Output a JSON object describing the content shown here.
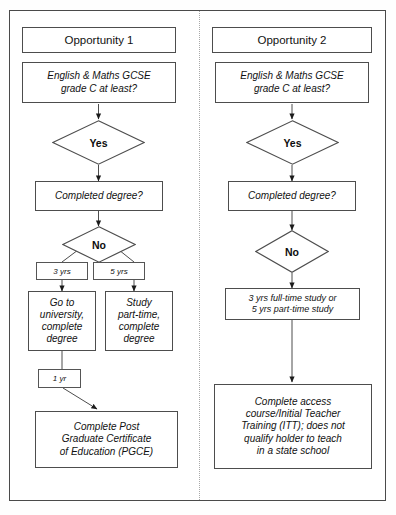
{
  "diagram": {
    "type": "flowchart",
    "columns": [
      {
        "id": "opportunity-1",
        "header": "Opportunity 1",
        "nodes": [
          {
            "id": "gcse-1",
            "shape": "process",
            "text": "English & Maths GCSE grade C at least?"
          },
          {
            "id": "yes-1",
            "shape": "decision",
            "text": "Yes"
          },
          {
            "id": "degree-1",
            "shape": "process",
            "text": "Completed degree?"
          },
          {
            "id": "no-1",
            "shape": "decision",
            "text": "No"
          },
          {
            "id": "three-yrs",
            "shape": "edge-label",
            "text": "3 yrs"
          },
          {
            "id": "five-yrs",
            "shape": "edge-label",
            "text": "5 yrs"
          },
          {
            "id": "university",
            "shape": "process",
            "text": "Go to university, complete degree"
          },
          {
            "id": "part-time",
            "shape": "process",
            "text": "Study part-time, complete degree"
          },
          {
            "id": "one-yr",
            "shape": "edge-label",
            "text": "1 yr"
          },
          {
            "id": "pgce",
            "shape": "process",
            "text": "Complete Post Graduate Certificate of Education (PGCE)"
          }
        ]
      },
      {
        "id": "opportunity-2",
        "header": "Opportunity 2",
        "nodes": [
          {
            "id": "gcse-2",
            "shape": "process",
            "text": "English & Maths GCSE grade C at least?"
          },
          {
            "id": "yes-2",
            "shape": "decision",
            "text": "Yes"
          },
          {
            "id": "degree-2",
            "shape": "process",
            "text": "Completed degree?"
          },
          {
            "id": "no-2",
            "shape": "decision",
            "text": "No"
          },
          {
            "id": "study-options",
            "shape": "process",
            "text": "3 yrs full-time study or 5 yrs part-time study"
          },
          {
            "id": "access-itt",
            "shape": "process",
            "text": "Complete access course/Initial Teacher Training (ITT); does not qualify holder to teach in a state school"
          }
        ]
      }
    ]
  },
  "left": {
    "header": "Opportunity 1",
    "gcse_line1": "English & Maths GCSE",
    "gcse_line2": "grade C at least?",
    "yes": "Yes",
    "completed_degree": "Completed degree?",
    "no": "No",
    "three_yrs": "3 yrs",
    "five_yrs": "5 yrs",
    "university_line1": "Go to",
    "university_line2": "university,",
    "university_line3": "complete",
    "university_line4": "degree",
    "parttime_line1": "Study",
    "parttime_line2": "part-time,",
    "parttime_line3": "complete",
    "parttime_line4": "degree",
    "one_yr": "1 yr",
    "pgce_line1": "Complete Post",
    "pgce_line2": "Graduate Certificate",
    "pgce_line3": "of Education (PGCE)"
  },
  "right": {
    "header": "Opportunity 2",
    "gcse_line1": "English & Maths GCSE",
    "gcse_line2": "grade C at least?",
    "yes": "Yes",
    "completed_degree": "Completed degree?",
    "no": "No",
    "study_line1": "3 yrs full-time study or",
    "study_line2": "5 yrs part-time study",
    "access_line1": "Complete access",
    "access_line2": "course/Initial Teacher",
    "access_line3": "Training (ITT); does not",
    "access_line4": "qualify holder to teach",
    "access_line5": "in a state school"
  },
  "colors": {
    "frame": "#4a4a4a",
    "box_border": "#4d4d4d",
    "divider": "#a8a8a8",
    "text": "#111111",
    "background": "#ffffff"
  }
}
